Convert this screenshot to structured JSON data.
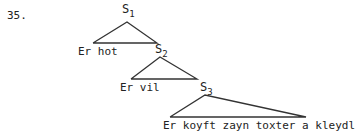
{
  "example_number": "35.",
  "nodes": [
    {
      "label": "S",
      "subscript": "1",
      "leaf_text": "Er hot"
    },
    {
      "label": "S",
      "subscript": "2",
      "leaf_text": "Er vil"
    },
    {
      "label": "S",
      "subscript": "3",
      "leaf_text": "Er koyft zayn toxter a kleydl"
    }
  ],
  "line_color": "#333333"
}
